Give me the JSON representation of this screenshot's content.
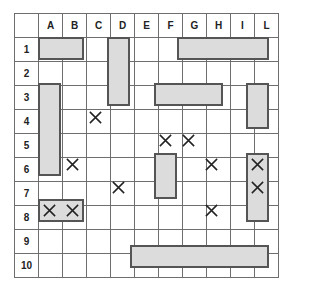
{
  "board": {
    "columns": [
      "A",
      "B",
      "C",
      "D",
      "E",
      "F",
      "G",
      "H",
      "I",
      "L"
    ],
    "rows": [
      "1",
      "2",
      "3",
      "4",
      "5",
      "6",
      "7",
      "8",
      "9",
      "10"
    ],
    "ships": [
      {
        "start": "A1",
        "end": "B1",
        "orientation": "horizontal",
        "length": 2
      },
      {
        "start": "D1",
        "end": "D3",
        "orientation": "vertical",
        "length": 3
      },
      {
        "start": "G1",
        "end": "L1",
        "orientation": "horizontal",
        "length": 4
      },
      {
        "start": "A3",
        "end": "A6",
        "orientation": "vertical",
        "length": 4
      },
      {
        "start": "F3",
        "end": "H3",
        "orientation": "horizontal",
        "length": 3
      },
      {
        "start": "L3",
        "end": "L4",
        "orientation": "vertical",
        "length": 2
      },
      {
        "start": "F6",
        "end": "F7",
        "orientation": "vertical",
        "length": 2
      },
      {
        "start": "L6",
        "end": "L8",
        "orientation": "vertical",
        "length": 3
      },
      {
        "start": "A8",
        "end": "B8",
        "orientation": "horizontal",
        "length": 2
      },
      {
        "start": "E10",
        "end": "L10",
        "orientation": "horizontal",
        "length": 6
      }
    ],
    "shots": [
      "C4",
      "F5",
      "G5",
      "B6",
      "H6",
      "L6",
      "D7",
      "L7",
      "A8",
      "B8",
      "H8"
    ],
    "colors": {
      "ship_fill": "#dcdcdc",
      "ship_border": "#555555",
      "grid_line": "#6e6e6e",
      "mark": "#222222"
    }
  }
}
